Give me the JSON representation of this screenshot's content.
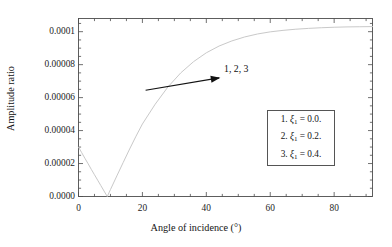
{
  "figure": {
    "background_color": "#ffffff",
    "frame_color": "#4d4d4d",
    "curve_color": "#c9c9c9",
    "annotation_color": "#111111"
  },
  "chart_data": {
    "type": "line",
    "title": "",
    "xlabel": "Angle of incidence (°)",
    "ylabel": "Amplitude ratio",
    "xlim": [
      0,
      92
    ],
    "ylim": [
      0,
      0.000108
    ],
    "grid": false,
    "legend_position": "lower-right-inside",
    "xticks": [
      0,
      20,
      40,
      60,
      80
    ],
    "xticklabels": [
      "0",
      "20",
      "40",
      "60",
      "80"
    ],
    "yticks": [
      0.0,
      2e-05,
      4e-05,
      6e-05,
      8e-05,
      0.0001
    ],
    "yticklabels": [
      "0.0000",
      "0.00002",
      "0.00004",
      "0.00006",
      "0.00008",
      "0.0001"
    ],
    "minor_ticks": true,
    "series": [
      {
        "name": "1, 2, 3 (overlapping curves)",
        "color": "#c9c9c9",
        "x": [
          0,
          1,
          2,
          3,
          4,
          5,
          6,
          7,
          8,
          9,
          10,
          12,
          14,
          16,
          18,
          20,
          24,
          28,
          32,
          36,
          40,
          44,
          48,
          52,
          56,
          60,
          64,
          68,
          72,
          76,
          80,
          84,
          88,
          92
        ],
        "y": [
          3e-05,
          2.66e-05,
          2.32e-05,
          1.99e-05,
          1.65e-05,
          1.32e-05,
          9.9e-06,
          6.6e-06,
          3.3e-06,
          0.0,
          4.2e-06,
          1.25e-05,
          2.07e-05,
          2.88e-05,
          3.66e-05,
          4.4e-05,
          5.6e-05,
          6.65e-05,
          7.5e-05,
          8.18e-05,
          8.72e-05,
          9.13e-05,
          9.44e-05,
          9.68e-05,
          9.86e-05,
          9.99e-05,
          0.0001008,
          0.0001015,
          0.000102,
          0.0001024,
          0.0001027,
          0.0001029,
          0.000103,
          0.0001031
        ]
      }
    ],
    "annotations": [
      {
        "text": "1, 2, 3",
        "arrow_from_x": 21,
        "arrow_from_y": 6.45e-05,
        "arrow_to_x": 44,
        "arrow_to_y": 7.2e-05
      }
    ],
    "legend_entries": [
      {
        "index": "1.",
        "symbol": "ξ",
        "subscript": "1",
        "equals": "=",
        "value": "0.0."
      },
      {
        "index": "2.",
        "symbol": "ξ",
        "subscript": "1",
        "equals": "=",
        "value": "0.2."
      },
      {
        "index": "3.",
        "symbol": "ξ",
        "subscript": "1",
        "equals": "=",
        "value": "0.4."
      }
    ]
  },
  "axis": {
    "xlabel": "Angle of incidence (°)",
    "ylabel": "Amplitude ratio",
    "xticklabels": [
      "0",
      "20",
      "40",
      "60",
      "80"
    ],
    "yticklabels": [
      "0.0000",
      "0.00002",
      "0.00004",
      "0.00006",
      "0.00008",
      "0.0001"
    ]
  },
  "annotation": {
    "label": "1, 2, 3"
  },
  "legend": {
    "lines": [
      "1. ξ₁ = 0.0.",
      "2. ξ₁ = 0.2.",
      "3. ξ₁ = 0.4."
    ]
  }
}
